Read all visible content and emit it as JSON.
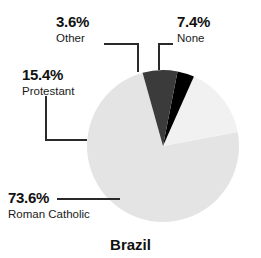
{
  "chart_data": {
    "type": "pie",
    "title": "Brazil",
    "xlabel": "",
    "ylabel": "",
    "legend_position": "callout-labels",
    "grid": false,
    "categories": [
      "Roman Catholic",
      "Protestant",
      "Other",
      "None"
    ],
    "values": [
      73.6,
      15.4,
      3.6,
      7.4
    ],
    "value_labels": [
      "73.6%",
      "15.4%",
      "3.6%",
      "7.4%"
    ],
    "colors": [
      "#e4e4e4",
      "#f1f1f1",
      "#000000",
      "#3b3b3b"
    ],
    "slices": [
      {
        "name": "Roman Catholic",
        "value": 73.6,
        "value_label": "73.6%",
        "color": "#e4e4e4",
        "start_angle": 11.0,
        "end_angle": 276.0
      },
      {
        "name": "Protestant",
        "value": 15.4,
        "value_label": "15.4%",
        "color": "#f1f1f1",
        "start_angle": 276.0,
        "end_angle": 331.4
      },
      {
        "name": "Other",
        "value": 3.6,
        "value_label": "3.6%",
        "color": "#000000",
        "start_angle": 331.4,
        "end_angle": 344.4
      },
      {
        "name": "None",
        "value": 7.4,
        "value_label": "7.4%",
        "color": "#3b3b3b",
        "start_angle": 344.4,
        "end_angle": 371.0
      }
    ]
  },
  "labels": {
    "other": {
      "percent": "3.6%",
      "name": "Other"
    },
    "none": {
      "percent": "7.4%",
      "name": "None"
    },
    "protestant": {
      "percent": "15.4%",
      "name": "Protestant"
    },
    "catholic": {
      "percent": "73.6%",
      "name": "Roman Catholic"
    }
  },
  "title": "Brazil",
  "style": {
    "background": "#ffffff",
    "leader_line_color": "#2a2a2a",
    "text_color": "#111111"
  }
}
